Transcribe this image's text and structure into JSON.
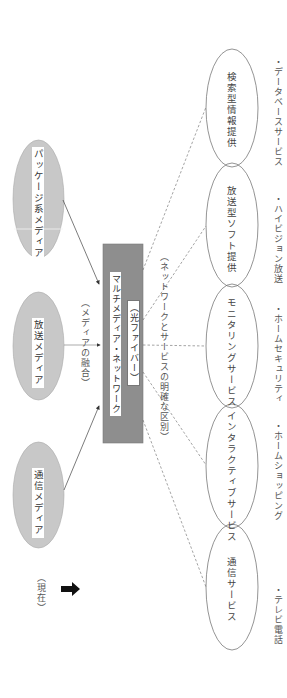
{
  "diagram": {
    "now_label": "（現在）",
    "sources": [
      {
        "label": "パッケージ系メディア"
      },
      {
        "label": "放送メディア"
      },
      {
        "label": "通信メディア"
      }
    ],
    "fusion_label": "（メディアの融合）",
    "network": {
      "title": "マルチメディア・ネットワーク",
      "subtitle": "（光ファイバー）"
    },
    "separation_label": "（ネットワークとサービスの明確な区別）",
    "services": [
      {
        "label": "検索型情報提供",
        "example": "・データベースサービス"
      },
      {
        "label": "放送型ソフト提供",
        "example": "・ハイビジョン放送"
      },
      {
        "label": "モニタリングサービス",
        "example": "・ホームセキュリティ"
      },
      {
        "label": "インタラクティブサービス",
        "example": "・ホームショッピング"
      },
      {
        "label": "通信サービス",
        "example": "・テレビ電話"
      }
    ],
    "colors": {
      "source_fill": "#c8c8c8",
      "network_fill": "#8e8e8e",
      "line": "#555555",
      "service_stroke": "#666666"
    }
  }
}
